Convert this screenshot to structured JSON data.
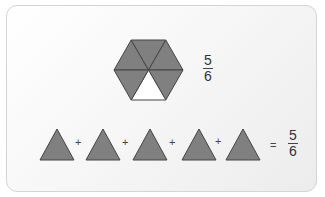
{
  "figure": {
    "hexagon": {
      "total_parts": 6,
      "shaded_parts": 5,
      "unshaded_part": "bottom",
      "fraction": {
        "numerator": "5",
        "denominator": "6"
      }
    },
    "equation": {
      "terms": [
        "triangle",
        "triangle",
        "triangle",
        "triangle",
        "triangle"
      ],
      "operator_plus": "+",
      "operator_equals": "=",
      "result": {
        "numerator": "5",
        "denominator": "6"
      }
    },
    "colors": {
      "shaded_fill": "#808080",
      "stroke": "#444444",
      "unshaded_fill": "#ffffff",
      "card_border": "#d4d4d4"
    }
  }
}
